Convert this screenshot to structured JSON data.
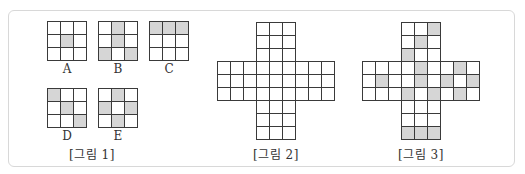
{
  "figure1": {
    "caption": "[그림 1]",
    "patterns": [
      {
        "label": "A",
        "rows": 3,
        "cols": 3,
        "shaded": [
          [
            1,
            1
          ]
        ]
      },
      {
        "label": "B",
        "rows": 3,
        "cols": 3,
        "shaded": [
          [
            0,
            1
          ],
          [
            1,
            1
          ],
          [
            2,
            0
          ],
          [
            2,
            2
          ]
        ]
      },
      {
        "label": "C",
        "rows": 3,
        "cols": 3,
        "shaded": [
          [
            0,
            0
          ],
          [
            0,
            1
          ],
          [
            0,
            2
          ]
        ]
      },
      {
        "label": "D",
        "rows": 3,
        "cols": 3,
        "shaded": [
          [
            0,
            0
          ],
          [
            1,
            1
          ],
          [
            2,
            2
          ]
        ]
      },
      {
        "label": "E",
        "rows": 3,
        "cols": 3,
        "shaded": [
          [
            0,
            1
          ],
          [
            1,
            0
          ],
          [
            1,
            2
          ],
          [
            2,
            1
          ]
        ]
      }
    ]
  },
  "figure2": {
    "caption": "[그림 2]",
    "shape": "cross",
    "size": 9,
    "arm_width": 3,
    "shaded": []
  },
  "figure3": {
    "caption": "[그림 3]",
    "shape": "cross",
    "size": 9,
    "arm_width": 3,
    "shaded": [
      [
        0,
        5
      ],
      [
        1,
        4
      ],
      [
        2,
        3
      ],
      [
        3,
        4
      ],
      [
        3,
        7
      ],
      [
        4,
        1
      ],
      [
        4,
        4
      ],
      [
        4,
        6
      ],
      [
        4,
        8
      ],
      [
        5,
        3
      ],
      [
        5,
        5
      ],
      [
        5,
        7
      ],
      [
        8,
        3
      ],
      [
        8,
        4
      ],
      [
        8,
        5
      ]
    ]
  },
  "colors": {
    "shade": "#d6d6d6",
    "line": "#3a3a3a",
    "frame": "#d8d8d8"
  }
}
